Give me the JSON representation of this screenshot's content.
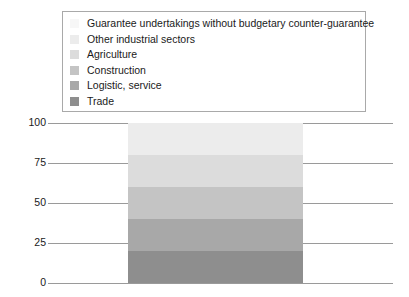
{
  "legend": {
    "position": "top-inside-box",
    "entries": [
      {
        "label": "Guarantee undertakings without budgetary counter-guarantee",
        "color": "#f7f7f7"
      },
      {
        "label": "Other industrial sectors",
        "color": "#ececec"
      },
      {
        "label": "Agriculture",
        "color": "#dcdcdc"
      },
      {
        "label": "Construction",
        "color": "#c4c4c4"
      },
      {
        "label": "Logistic, service",
        "color": "#a8a8a8"
      },
      {
        "label": "Trade",
        "color": "#8e8e8e"
      }
    ]
  },
  "axis": {
    "y_ticks": [
      "100",
      "75",
      "50",
      "25",
      "0"
    ]
  },
  "chart_data": {
    "type": "bar",
    "subtype": "stacked-bar-100pct",
    "title": "",
    "subtitle": "",
    "xlabel": "",
    "ylabel": "",
    "ylim": [
      0,
      100
    ],
    "yticks": [
      0,
      25,
      50,
      75,
      100
    ],
    "grid": true,
    "legend_position": "top",
    "categories": [
      ""
    ],
    "series": [
      {
        "name": "Guarantee undertakings without budgetary counter-guarantee",
        "color": "#f7f7f7",
        "values": [
          0
        ]
      },
      {
        "name": "Other industrial sectors",
        "color": "#ececec",
        "values": [
          20
        ]
      },
      {
        "name": "Agriculture",
        "color": "#dcdcdc",
        "values": [
          20
        ]
      },
      {
        "name": "Construction",
        "color": "#c4c4c4",
        "values": [
          20
        ]
      },
      {
        "name": "Logistic, service",
        "color": "#a8a8a8",
        "values": [
          20
        ]
      },
      {
        "name": "Trade",
        "color": "#8e8e8e",
        "values": [
          20
        ]
      }
    ],
    "stack_order_bottom_to_top": [
      "Trade",
      "Logistic, service",
      "Construction",
      "Agriculture",
      "Other industrial sectors",
      "Guarantee undertakings without budgetary counter-guarantee"
    ],
    "annotations": []
  }
}
